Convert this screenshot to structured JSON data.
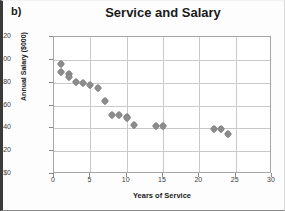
{
  "panel": {
    "label": "b)"
  },
  "chart_data": {
    "type": "scatter",
    "title": "Service and Salary",
    "xlabel": "Years of Service",
    "ylabel": "Annual Salary ($000)",
    "xlim": [
      0,
      30
    ],
    "ylim": [
      0,
      120
    ],
    "xticks": [
      0,
      5,
      10,
      15,
      20,
      25,
      30
    ],
    "yticks": [
      0,
      20,
      40,
      60,
      80,
      100,
      120
    ],
    "xtick_labels": [
      "0",
      "5",
      "10",
      "15",
      "20",
      "25",
      "30"
    ],
    "ytick_labels": [
      "$0",
      "$20",
      "$40",
      "$60",
      "$80",
      "$100",
      "$120"
    ],
    "grid": true,
    "legend": false,
    "marker_color": "#8c8c8c",
    "series": [
      {
        "name": "Employees",
        "x": [
          1,
          1,
          2,
          2,
          3,
          4,
          5,
          6,
          7,
          8,
          9,
          10,
          10,
          11,
          14,
          15,
          22,
          23,
          24
        ],
        "y": [
          96,
          89,
          88,
          85,
          81,
          80,
          78,
          75,
          64,
          52,
          52,
          50,
          49,
          43,
          42,
          42,
          39,
          39,
          35
        ]
      }
    ]
  }
}
